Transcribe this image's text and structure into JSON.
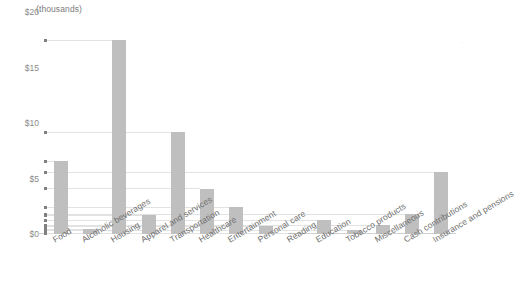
{
  "chart_data": {
    "type": "bar",
    "title": "",
    "subtitle": "",
    "unit_caption": "(thousands)",
    "xlabel": "",
    "ylabel": "",
    "ylim": [
      0,
      20
    ],
    "grid": true,
    "grid_style": "leader-lines-to-bar-tops",
    "legend": "none",
    "y_ticks": [
      {
        "label": "$0",
        "value": 0
      },
      {
        "label": "$5",
        "value": 5
      },
      {
        "label": "$10",
        "value": 10
      },
      {
        "label": "$15",
        "value": 15
      },
      {
        "label": "$20",
        "value": 20
      }
    ],
    "categories": [
      "Food",
      "Alcoholic beverages",
      "Housing",
      "Apparel and services",
      "Transportation",
      "Healthcare",
      "Entertainment",
      "Personal care",
      "Reading",
      "Education",
      "Tobacco products",
      "Miscellaneous",
      "Cash contributions",
      "Insurance and pensions"
    ],
    "values": [
      6.6,
      0.45,
      17.5,
      1.7,
      9.2,
      4.1,
      2.4,
      0.7,
      0.12,
      1.3,
      0.35,
      0.78,
      1.8,
      5.6
    ],
    "bar_color": "#bfbfbf",
    "gridline_color": "#e2e2e2",
    "axis_color": "#d0d0d0",
    "label_color": "#7b7b7b"
  }
}
